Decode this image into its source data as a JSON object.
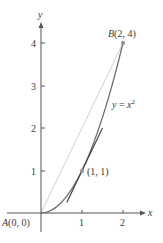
{
  "figure": {
    "curve_label": "y = x²",
    "curve_label_parts": {
      "lhs": "y",
      "eq": " = ",
      "var": "x",
      "exp": "2"
    },
    "axes": {
      "x_label": "x",
      "y_label": "y",
      "x_ticks": [
        "1",
        "2"
      ],
      "y_ticks": [
        "1",
        "2",
        "3",
        "4"
      ]
    },
    "points": [
      {
        "name": "A",
        "label": "A(0, 0)",
        "letter": "A",
        "coords": "(0, 0)",
        "x": 0,
        "y": 0
      },
      {
        "name": "B",
        "label": "B(2, 4)",
        "letter": "B",
        "coords": "(2, 4)",
        "x": 2,
        "y": 4
      },
      {
        "name": "P",
        "label": "(1, 1)",
        "x": 1,
        "y": 1
      }
    ],
    "elements": {
      "curve": "y = x^2 from x=0 to x=2",
      "secant": "chord from A(0,0) to B(2,4), slope 2",
      "tangent": "tangent at (1,1), slope 2, y = 2x - 1"
    },
    "colors": {
      "axis": "#555555",
      "curve": "#6a6a6a",
      "tangent": "#3c3c3c",
      "secant": "#d0d0d0",
      "point": "#9a9a9a",
      "text": "#3a3a3a"
    }
  }
}
